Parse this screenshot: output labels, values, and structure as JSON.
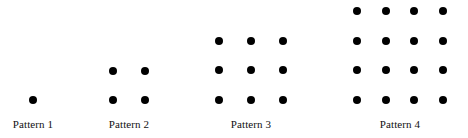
{
  "figure": {
    "title": "",
    "background_color": "#ffffff",
    "dot_color": "#000000",
    "label_color": "#111111",
    "width": 468,
    "height": 138,
    "baseline_y": 100,
    "dot_diameter": 8
  },
  "patterns": [
    {
      "label": "Pattern 1",
      "term_number": 1,
      "rows": 2,
      "columns": 1,
      "visible_rows": 1,
      "dot_count": 1,
      "center_x": 33,
      "col_spacing": 32,
      "row_spacing": 29.5,
      "label_y": 118,
      "dots": [
        {
          "row": 0,
          "col": 0,
          "x": 33,
          "y": 100
        }
      ]
    },
    {
      "label": "Pattern 2",
      "term_number": 2,
      "rows": 2,
      "columns": 2,
      "visible_rows": 2,
      "dot_count": 4,
      "center_x": 129,
      "col_spacing": 32,
      "row_spacing": 29.5,
      "label_y": 118,
      "dots": [
        {
          "row": 0,
          "col": 0,
          "x": 113,
          "y": 71
        },
        {
          "row": 0,
          "col": 1,
          "x": 145,
          "y": 71
        },
        {
          "row": 1,
          "col": 0,
          "x": 113,
          "y": 100
        },
        {
          "row": 1,
          "col": 1,
          "x": 145,
          "y": 100
        }
      ]
    },
    {
      "label": "Pattern 3",
      "term_number": 3,
      "rows": 3,
      "columns": 3,
      "visible_rows": 3,
      "dot_count": 9,
      "center_x": 251,
      "col_spacing": 32,
      "row_spacing": 29.5,
      "label_y": 118,
      "dots": [
        {
          "row": 0,
          "col": 0,
          "x": 219,
          "y": 41
        },
        {
          "row": 0,
          "col": 1,
          "x": 251,
          "y": 41
        },
        {
          "row": 0,
          "col": 2,
          "x": 283,
          "y": 41
        },
        {
          "row": 1,
          "col": 0,
          "x": 219,
          "y": 70
        },
        {
          "row": 1,
          "col": 1,
          "x": 251,
          "y": 70
        },
        {
          "row": 1,
          "col": 2,
          "x": 283,
          "y": 70
        },
        {
          "row": 2,
          "col": 0,
          "x": 219,
          "y": 100
        },
        {
          "row": 2,
          "col": 1,
          "x": 251,
          "y": 100
        },
        {
          "row": 2,
          "col": 2,
          "x": 283,
          "y": 100
        }
      ]
    },
    {
      "label": "Pattern 4",
      "term_number": 4,
      "rows": 4,
      "columns": 4,
      "visible_rows": 4,
      "dot_count": 16,
      "center_x": 400,
      "col_spacing": 28.7,
      "row_spacing": 29.7,
      "label_y": 118,
      "dots": [
        {
          "row": 0,
          "col": 0,
          "x": 357,
          "y": 11
        },
        {
          "row": 0,
          "col": 1,
          "x": 386,
          "y": 11
        },
        {
          "row": 0,
          "col": 2,
          "x": 414,
          "y": 11
        },
        {
          "row": 0,
          "col": 3,
          "x": 443,
          "y": 11
        },
        {
          "row": 1,
          "col": 0,
          "x": 357,
          "y": 41
        },
        {
          "row": 1,
          "col": 1,
          "x": 386,
          "y": 41
        },
        {
          "row": 1,
          "col": 2,
          "x": 414,
          "y": 41
        },
        {
          "row": 1,
          "col": 3,
          "x": 443,
          "y": 41
        },
        {
          "row": 2,
          "col": 0,
          "x": 357,
          "y": 70
        },
        {
          "row": 2,
          "col": 1,
          "x": 386,
          "y": 70
        },
        {
          "row": 2,
          "col": 2,
          "x": 414,
          "y": 70
        },
        {
          "row": 2,
          "col": 3,
          "x": 443,
          "y": 70
        },
        {
          "row": 3,
          "col": 0,
          "x": 357,
          "y": 100
        },
        {
          "row": 3,
          "col": 1,
          "x": 386,
          "y": 100
        },
        {
          "row": 3,
          "col": 2,
          "x": 414,
          "y": 100
        },
        {
          "row": 3,
          "col": 3,
          "x": 443,
          "y": 100
        }
      ]
    }
  ]
}
